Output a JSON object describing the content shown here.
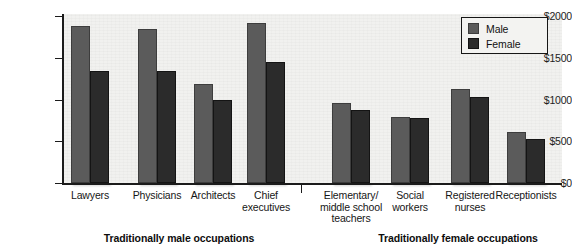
{
  "chart_data": {
    "type": "bar",
    "title": "",
    "xlabel": "",
    "ylabel": "",
    "ylim": [
      0,
      2000
    ],
    "ytick_labels": [
      "$0",
      "$500",
      "$1000",
      "$1500",
      "$2000"
    ],
    "ytick_values": [
      0,
      500,
      1000,
      1500,
      2000
    ],
    "grid": false,
    "legend_position": "top-right",
    "categories": [
      "Lawyers",
      "Physicians",
      "Architects",
      "Chief executives",
      "Elementary/ middle school teachers",
      "Social workers",
      "Registered nurses",
      "Receptionists"
    ],
    "series": [
      {
        "name": "Male",
        "color": "#5b5b5b",
        "values": [
          1880,
          1850,
          1190,
          1920,
          955,
          790,
          1120,
          610
        ]
      },
      {
        "name": "Female",
        "color": "#2b2b2b",
        "values": [
          1340,
          1345,
          1000,
          1450,
          880,
          775,
          1030,
          530
        ]
      }
    ],
    "groups": [
      {
        "label": "Traditionally male occupations",
        "categories": [
          0,
          1,
          2,
          3
        ]
      },
      {
        "label": "Traditionally female occupations",
        "categories": [
          4,
          5,
          6,
          7
        ]
      }
    ]
  },
  "axis": {
    "ticks": [
      {
        "label": "$2000",
        "value": 2000
      },
      {
        "label": "$1500",
        "value": 1500
      },
      {
        "label": "$1000",
        "value": 1000
      },
      {
        "label": "$500",
        "value": 500
      },
      {
        "label": "$0",
        "value": 0
      }
    ]
  },
  "categories": [
    {
      "lines": [
        "Lawyers"
      ]
    },
    {
      "lines": [
        "Physicians"
      ]
    },
    {
      "lines": [
        "Architects"
      ]
    },
    {
      "lines": [
        "Chief",
        "executives"
      ]
    },
    {
      "lines": [
        "Elementary/",
        "middle school",
        "teachers"
      ]
    },
    {
      "lines": [
        "Social",
        "workers"
      ]
    },
    {
      "lines": [
        "Registered",
        "nurses"
      ]
    },
    {
      "lines": [
        "Receptionists"
      ]
    }
  ],
  "groups": [
    {
      "label": "Traditionally male occupations"
    },
    {
      "label": "Traditionally female occupations"
    }
  ],
  "legend": {
    "items": [
      {
        "label": "Male",
        "color": "#5b5b5b"
      },
      {
        "label": "Female",
        "color": "#2b2b2b"
      }
    ]
  }
}
